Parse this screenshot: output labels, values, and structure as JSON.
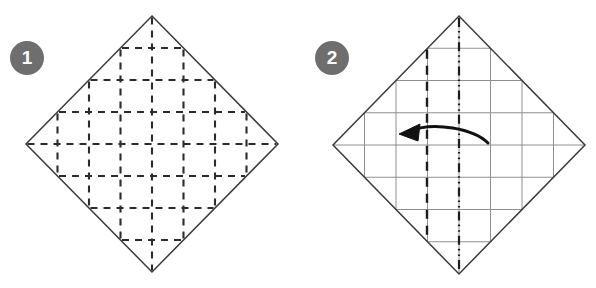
{
  "document": {
    "kind": "origami-instruction-diagram",
    "panel_count": 2,
    "background_color": "#ffffff",
    "line_color": "#333333",
    "grid_color": "#8c8c8c",
    "badge_color": "#6e6e6e",
    "badge_text_color": "#ffffff"
  },
  "panels": [
    {
      "id": "step-1",
      "badge_label": "1",
      "shape": "square rotated 45 degrees (diamond)",
      "center_x": 152,
      "center_y": 144,
      "half_width": 126,
      "half_height": 128,
      "outline_style": "solid",
      "grid": {
        "divisions": 8,
        "line_style": "dashed",
        "description": "eight by eight dashed crease grid filling the diamond",
        "interior_lines": 7
      },
      "arrow": null
    },
    {
      "id": "step-2",
      "badge_label": "2",
      "shape": "square rotated 45 degrees (diamond)",
      "center_x": 459,
      "center_y": 145,
      "half_width": 126,
      "half_height": 129,
      "outline_style": "solid",
      "grid": {
        "divisions": 8,
        "line_style": "solid-thin-gray",
        "description": "eight by eight light solid crease grid filling the diamond",
        "interior_lines": 7
      },
      "center_line": {
        "style": "dash-dot-dot",
        "orientation": "vertical",
        "meaning": "center line"
      },
      "fold_line": {
        "style": "dashed",
        "orientation": "vertical",
        "x": 427,
        "meaning": "valley fold"
      },
      "arrow": {
        "direction": "left",
        "style": "curved-solid-with-filled-head",
        "meaning": "fold the right edge over to the left along the dashed line"
      }
    }
  ]
}
